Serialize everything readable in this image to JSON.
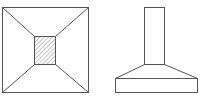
{
  "diagram": {
    "title": "",
    "views": [
      {
        "name": "plan-view",
        "description": "Top view of footing with hatched column section"
      },
      {
        "name": "elevation-view",
        "description": "Side view of column on tapered footing"
      }
    ],
    "colors": {
      "stroke": "#555555",
      "hatch": "#888888",
      "background": "#ffffff"
    }
  }
}
